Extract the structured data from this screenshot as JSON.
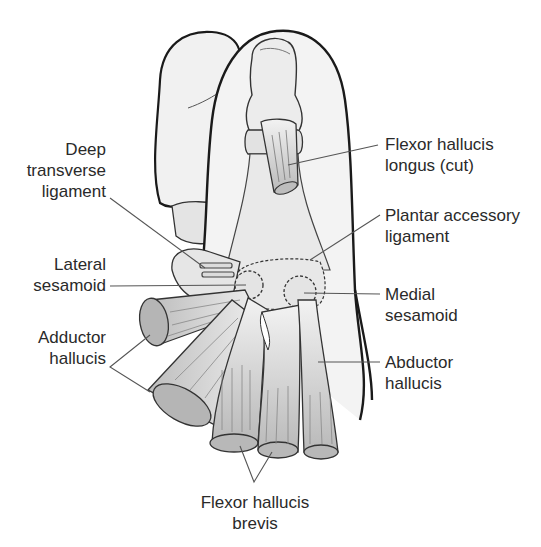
{
  "diagram": {
    "colors": {
      "outline": "#1a1a1a",
      "fill_light": "#ececec",
      "fill_mid": "#cfcfcf",
      "fill_dark": "#a8a8a8",
      "leader": "#555555",
      "text": "#2a2a2a"
    },
    "labels": {
      "deep_transverse_ligament": {
        "line1": "Deep",
        "line2": "transverse",
        "line3": "ligament"
      },
      "lateral_sesamoid": {
        "line1": "Lateral",
        "line2": "sesamoid"
      },
      "adductor_hallucis": {
        "line1": "Adductor",
        "line2": "hallucis"
      },
      "flexor_hallucis_longus": {
        "line1": "Flexor hallucis",
        "line2": "longus (cut)"
      },
      "plantar_accessory_ligament": {
        "line1": "Plantar accessory",
        "line2": "ligament"
      },
      "medial_sesamoid": {
        "line1": "Medial",
        "line2": "sesamoid"
      },
      "abductor_hallucis": {
        "line1": "Abductor",
        "line2": "hallucis"
      },
      "flexor_hallucis_brevis": {
        "line1": "Flexor hallucis",
        "line2": "brevis"
      }
    }
  }
}
